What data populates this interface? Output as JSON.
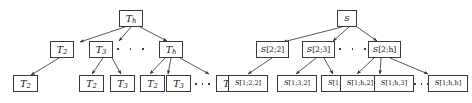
{
  "figure": {
    "title": "",
    "background_color": "#ffffff",
    "line_color": "#3a3a3a",
    "text_color": "#111111",
    "width": 472,
    "height": 103
  },
  "left_tree": {
    "name": "recursion-tree-T",
    "root": {
      "base": "T",
      "sub": "h"
    },
    "level2": [
      {
        "base": "T",
        "sub": "2"
      },
      {
        "base": "T",
        "sub": "3"
      },
      {
        "base": "T",
        "sub": "h"
      }
    ],
    "level3": [
      {
        "base": "T",
        "sub": "2"
      },
      {
        "base": "T",
        "sub": "2"
      },
      {
        "base": "T",
        "sub": "3"
      },
      {
        "base": "T",
        "sub": "2"
      },
      {
        "base": "T",
        "sub": "3"
      },
      {
        "base": "T",
        "sub": "h"
      }
    ],
    "ellipsis_level2": "•  •  •",
    "ellipsis_level3": "• • •"
  },
  "right_tree": {
    "name": "recursion-tree-S",
    "root": {
      "base": "S",
      "index": ""
    },
    "level2": [
      {
        "base": "S",
        "index": "[2;2]"
      },
      {
        "base": "S",
        "index": "[2;3]"
      },
      {
        "base": "S",
        "index": "[2;h]"
      }
    ],
    "level3": [
      {
        "base": "S",
        "index": "[1;2,2]"
      },
      {
        "base": "S",
        "index": "[1;3,2]"
      },
      {
        "base": "S",
        "index": "[1;3,3]"
      },
      {
        "base": "S",
        "index": "[1;h,2]"
      },
      {
        "base": "S",
        "index": "[1;h,3]"
      },
      {
        "base": "S",
        "index": "[1;h,h]"
      }
    ],
    "ellipsis_level2": "•  •  •",
    "ellipsis_level3": "• • •"
  }
}
